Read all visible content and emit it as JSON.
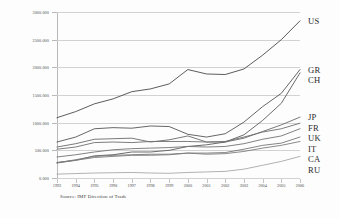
{
  "chart_data": {
    "type": "line",
    "title": "",
    "xlabel": "",
    "ylabel": "Billion US$",
    "source": "Source: IMF Direction of Trade",
    "grid": true,
    "legend_position": "right-inline",
    "x": [
      1993,
      1994,
      1995,
      1996,
      1997,
      1998,
      1999,
      2000,
      2001,
      2002,
      2003,
      2004,
      2005,
      2006
    ],
    "xtick_labels": [
      "1993",
      "1994",
      "1995",
      "1996",
      "1997",
      "1998",
      "1999",
      "2000",
      "2001",
      "2002",
      "2003",
      "2004",
      "2005",
      "2006"
    ],
    "ytick_labels": [
      "0.000",
      "500.000",
      "1000.000",
      "1500.000",
      "2000.000",
      "2500.000",
      "3000.000"
    ],
    "ytick_values": [
      0,
      500,
      1000,
      1500,
      2000,
      2500,
      3000
    ],
    "ylim": [
      0,
      3000
    ],
    "xlim": [
      1993,
      2006
    ],
    "series": [
      {
        "name": "US",
        "label": "US",
        "color": "#4a4a4a",
        "values": [
          1090,
          1200,
          1340,
          1430,
          1560,
          1610,
          1700,
          1960,
          1880,
          1870,
          1970,
          2220,
          2500,
          2840
        ]
      },
      {
        "name": "GR",
        "label": "GR",
        "color": "#555555",
        "values": [
          650,
          740,
          890,
          910,
          900,
          940,
          930,
          790,
          740,
          800,
          1010,
          1290,
          1530,
          1960
        ]
      },
      {
        "name": "CH",
        "label": "CH",
        "color": "#5a5a5a",
        "values": [
          280,
          320,
          400,
          420,
          470,
          470,
          500,
          570,
          600,
          650,
          780,
          1040,
          1350,
          1900
        ]
      },
      {
        "name": "JP",
        "label": "JP",
        "color": "#6a6a6a",
        "values": [
          560,
          620,
          700,
          710,
          720,
          650,
          690,
          760,
          650,
          650,
          720,
          840,
          960,
          1100
        ]
      },
      {
        "name": "FR",
        "label": "FR",
        "color": "#6e6e6e",
        "values": [
          520,
          560,
          640,
          650,
          640,
          660,
          660,
          660,
          650,
          660,
          740,
          830,
          890,
          990
        ]
      },
      {
        "name": "UK",
        "label": "UK",
        "color": "#737373",
        "values": [
          380,
          420,
          470,
          510,
          530,
          540,
          550,
          570,
          560,
          570,
          620,
          700,
          760,
          890
        ]
      },
      {
        "name": "IT",
        "label": "IT",
        "color": "#777777",
        "values": [
          275,
          330,
          390,
          410,
          420,
          430,
          430,
          450,
          450,
          460,
          520,
          590,
          630,
          740
        ]
      },
      {
        "name": "CA",
        "label": "CA",
        "color": "#7d7d7d",
        "values": [
          270,
          320,
          370,
          390,
          410,
          410,
          420,
          450,
          430,
          440,
          480,
          540,
          590,
          660
        ]
      },
      {
        "name": "RU",
        "label": "RU",
        "color": "#a8a8a8",
        "values": [
          70,
          80,
          90,
          95,
          100,
          90,
          85,
          100,
          110,
          120,
          160,
          230,
          300,
          390
        ]
      }
    ]
  }
}
